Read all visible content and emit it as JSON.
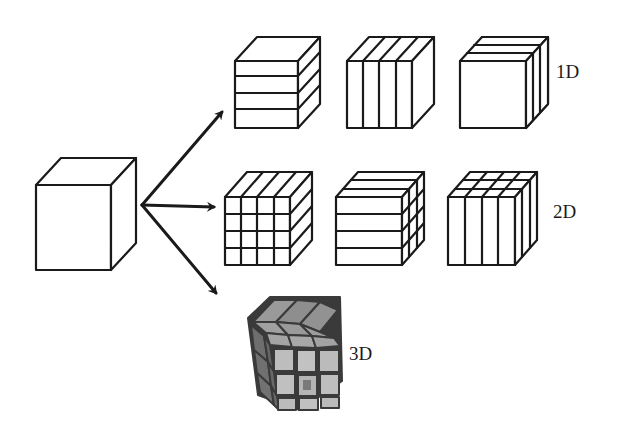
{
  "diagram": {
    "source": {
      "name": "undivided cube"
    },
    "arrows": [
      {
        "target": "1D row"
      },
      {
        "target": "2D row"
      },
      {
        "target": "3D cube"
      }
    ],
    "rows": [
      {
        "label": "1D",
        "cubes": [
          {
            "name": "horizontal slabs",
            "splits": "4 horizontal slices along Y"
          },
          {
            "name": "vertical slabs",
            "splits": "4 vertical slices along X"
          },
          {
            "name": "depth slabs",
            "splits": "3 slices along Z"
          }
        ]
      },
      {
        "label": "2D",
        "cubes": [
          {
            "name": "X-Y columns",
            "splits": "4x4 grid on front face"
          },
          {
            "name": "Y-Z rods",
            "splits": "4 horizontal x 3 depth"
          },
          {
            "name": "X-Z rods",
            "splits": "4 vertical x 3 depth"
          }
        ]
      },
      {
        "label": "3D",
        "cubes": [
          {
            "name": "3x3x3 blocks (Rubik's cube)",
            "splits": "3x3x3"
          }
        ]
      }
    ],
    "colors": {
      "line": "#1a1a1a",
      "background": "#ffffff",
      "rubik_light": "#b9b9b9",
      "rubik_mid": "#8e8e8e",
      "rubik_dark": "#6a6a6a",
      "rubik_gap": "#3a3a3a"
    }
  }
}
